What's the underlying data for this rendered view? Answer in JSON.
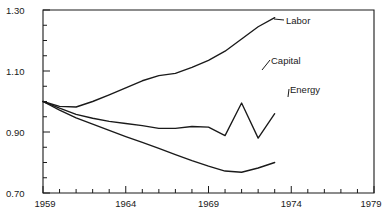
{
  "chart_data": {
    "type": "line",
    "title": "",
    "xlabel": "",
    "ylabel": "",
    "xlim": [
      1959,
      1979
    ],
    "ylim": [
      0.7,
      1.3
    ],
    "grid": false,
    "legend_position": "inline-right-of-line-end",
    "x_ticks_major": [
      1959,
      1964,
      1969,
      1974,
      1979
    ],
    "x_ticks_minor_step": 1,
    "y_ticks_major": [
      0.7,
      0.9,
      1.1,
      1.3
    ],
    "y_ticks_minor_step": 0.025,
    "x_tick_labels": [
      "1959",
      "1964",
      "1969",
      "1974",
      "1979"
    ],
    "y_tick_labels": [
      "1.30",
      "1.10",
      "0.90",
      "0.70"
    ],
    "x": [
      1959,
      1960,
      1961,
      1962,
      1963,
      1964,
      1965,
      1966,
      1967,
      1968,
      1969,
      1970,
      1971,
      1972,
      1973
    ],
    "series": [
      {
        "name": "Labor",
        "label": "Labor",
        "color": "#1a1a1a",
        "values": [
          1.0,
          0.984,
          0.982,
          1.0,
          1.022,
          1.045,
          1.068,
          1.085,
          1.092,
          1.112,
          1.135,
          1.165,
          1.205,
          1.245,
          1.275
        ]
      },
      {
        "name": "Capital",
        "label": "Capital",
        "color": "#1a1a1a",
        "values": [
          1.0,
          0.978,
          0.958,
          0.945,
          0.935,
          0.928,
          0.921,
          0.912,
          0.912,
          0.918,
          0.916,
          0.888,
          0.995,
          0.88,
          0.96
        ]
      },
      {
        "name": "Energy",
        "label": "Energy",
        "color": "#1a1a1a",
        "values": [
          1.0,
          0.972,
          0.946,
          0.926,
          0.905,
          0.885,
          0.866,
          0.846,
          0.826,
          0.806,
          0.788,
          0.772,
          0.768,
          0.782,
          0.8
        ]
      }
    ],
    "series_label_anchors": [
      {
        "name": "Labor",
        "x": 286,
        "y": 21
      },
      {
        "name": "Capital",
        "x": 271,
        "y": 61
      },
      {
        "name": "Energy",
        "x": 290,
        "y": 90
      }
    ]
  },
  "axes": {
    "plot_left_px": 43,
    "plot_right_px": 374,
    "plot_top_px": 10,
    "plot_bottom_px": 193
  }
}
